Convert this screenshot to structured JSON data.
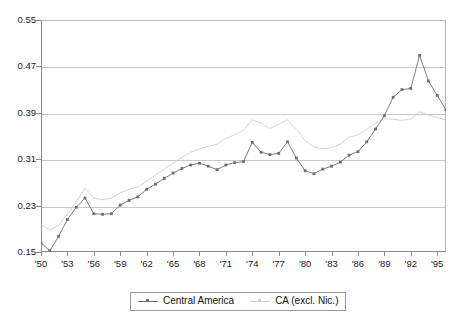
{
  "chart_data": {
    "type": "line",
    "title": "",
    "xlabel": "",
    "ylabel": "",
    "ylim": [
      0.15,
      0.55
    ],
    "ytick_values": [
      0.55,
      0.47,
      0.39,
      0.31,
      0.23,
      0.15
    ],
    "ytick_labels": [
      "0.55",
      "0.47",
      "0.39",
      "0.31",
      "0.23",
      "0.15"
    ],
    "grid": true,
    "grid_axis": "y",
    "legend_position": "bottom-center",
    "x": [
      1950,
      1951,
      1952,
      1953,
      1954,
      1955,
      1956,
      1957,
      1958,
      1959,
      1960,
      1961,
      1962,
      1963,
      1964,
      1965,
      1966,
      1967,
      1968,
      1969,
      1970,
      1971,
      1972,
      1973,
      1974,
      1975,
      1976,
      1977,
      1978,
      1979,
      1980,
      1981,
      1982,
      1983,
      1984,
      1985,
      1986,
      1987,
      1988,
      1989,
      1990,
      1991,
      1992,
      1993,
      1994,
      1995,
      1996
    ],
    "xtick_labels": [
      "'50",
      "'53",
      "'56",
      "'59",
      "'62",
      "'65",
      "'68",
      "'71",
      "'74",
      "'77",
      "'80",
      "'83",
      "'86",
      "'89",
      "'92",
      "'95"
    ],
    "xtick_values": [
      1950,
      1953,
      1956,
      1959,
      1962,
      1965,
      1968,
      1971,
      1974,
      1977,
      1980,
      1983,
      1986,
      1989,
      1992,
      1995
    ],
    "series": [
      {
        "name": "Central America",
        "color": "#6e6e6e",
        "marker": "square",
        "values": [
          0.166,
          0.152,
          0.177,
          0.206,
          0.227,
          0.243,
          0.216,
          0.215,
          0.216,
          0.231,
          0.239,
          0.245,
          0.258,
          0.267,
          0.277,
          0.286,
          0.294,
          0.3,
          0.303,
          0.298,
          0.292,
          0.3,
          0.304,
          0.306,
          0.339,
          0.322,
          0.318,
          0.32,
          0.34,
          0.312,
          0.29,
          0.285,
          0.293,
          0.298,
          0.305,
          0.317,
          0.323,
          0.34,
          0.362,
          0.385,
          0.417,
          0.43,
          0.432,
          0.489,
          0.445,
          0.42,
          0.395
        ]
      },
      {
        "name": "CA (excl. Nic.)",
        "color": "#cfcfcf",
        "marker": "none",
        "values": [
          0.197,
          0.188,
          0.196,
          0.215,
          0.237,
          0.26,
          0.243,
          0.24,
          0.243,
          0.252,
          0.258,
          0.262,
          0.272,
          0.283,
          0.293,
          0.303,
          0.313,
          0.322,
          0.328,
          0.332,
          0.336,
          0.346,
          0.352,
          0.36,
          0.378,
          0.372,
          0.363,
          0.37,
          0.378,
          0.362,
          0.342,
          0.331,
          0.328,
          0.33,
          0.336,
          0.348,
          0.352,
          0.362,
          0.372,
          0.38,
          0.379,
          0.377,
          0.379,
          0.392,
          0.386,
          0.382,
          0.377
        ]
      }
    ]
  },
  "legend": {
    "entries": [
      {
        "label": "Central America"
      },
      {
        "label": "CA (excl. Nic.)"
      }
    ]
  }
}
